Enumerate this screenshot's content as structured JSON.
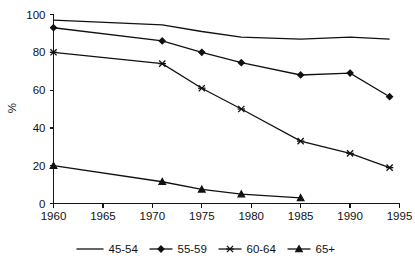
{
  "chart_data": {
    "type": "line",
    "title": "",
    "subtitle": "",
    "xlabel": "",
    "ylabel": "%",
    "xlim": [
      1960,
      1995
    ],
    "ylim": [
      0,
      100
    ],
    "grid": false,
    "legend_position": "bottom",
    "x_ticks": [
      "1960",
      "1965",
      "1970",
      "1975",
      "1980",
      "1985",
      "1990",
      "1995"
    ],
    "x_tick_values": [
      1960,
      1965,
      1970,
      1975,
      1980,
      1985,
      1990,
      1995
    ],
    "y_ticks": [
      "0",
      "20",
      "40",
      "60",
      "80",
      "100"
    ],
    "y_tick_values": [
      0,
      20,
      40,
      60,
      80,
      100
    ],
    "series": [
      {
        "name": "45-54",
        "marker": "none",
        "color": "#111111",
        "x": [
          1960,
          1971,
          1975,
          1979,
          1985,
          1990,
          1994
        ],
        "values": [
          97,
          94.5,
          91,
          88,
          87,
          88,
          87
        ]
      },
      {
        "name": "55-59",
        "marker": "diamond",
        "color": "#111111",
        "x": [
          1960,
          1971,
          1975,
          1979,
          1985,
          1990,
          1994
        ],
        "values": [
          93,
          86,
          80,
          74.5,
          68,
          69,
          56.5
        ]
      },
      {
        "name": "60-64",
        "marker": "cross",
        "color": "#111111",
        "x": [
          1960,
          1971,
          1975,
          1979,
          1985,
          1990,
          1994
        ],
        "values": [
          80,
          74,
          61,
          50,
          33,
          26.5,
          19
        ]
      },
      {
        "name": "65+",
        "marker": "triangle",
        "color": "#111111",
        "x": [
          1960,
          1971,
          1975,
          1979,
          1985
        ],
        "values": [
          20,
          11.5,
          7.5,
          5,
          3
        ]
      }
    ]
  },
  "legend": {
    "items": [
      {
        "label": "45-54",
        "marker": "none"
      },
      {
        "label": "55-59",
        "marker": "diamond"
      },
      {
        "label": "60-64",
        "marker": "cross"
      },
      {
        "label": "65+",
        "marker": "triangle"
      }
    ]
  }
}
